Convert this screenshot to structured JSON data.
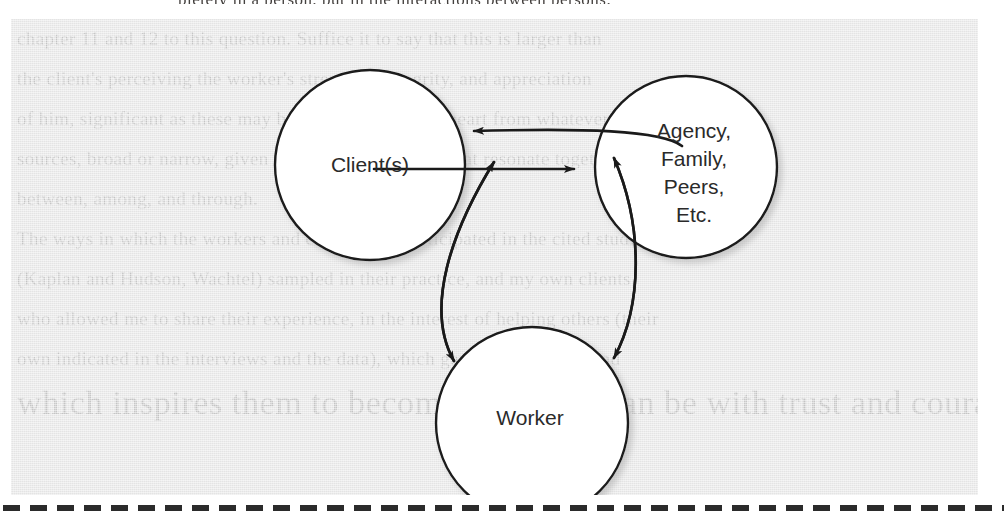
{
  "figure": {
    "panel_background_color": "#e4e4e4",
    "stroke_color": "#1a1a1a",
    "node_fill_color": "#ffffff",
    "nodes": [
      {
        "id": "client",
        "label": "Client(s)",
        "cx": 348,
        "cy": 127,
        "r": 95
      },
      {
        "id": "agency",
        "label": "Agency,\nFamily,\nPeers,\nEtc.",
        "cx": 664,
        "cy": 129,
        "r": 91
      },
      {
        "id": "worker",
        "label": "Worker",
        "cx": 510,
        "cy": 385,
        "r": 96
      }
    ],
    "node_labels": {
      "client": "Client(s)",
      "agency_line1": "Agency,",
      "agency_line2": "Family,",
      "agency_line3": "Peers,",
      "agency_line4": "Etc.",
      "worker": "Worker"
    },
    "connections": [
      {
        "from": "agency",
        "to": "client",
        "style": "arrow-single",
        "direction": "leftward",
        "description": "Agency/Family/Peers influence Client(s)"
      },
      {
        "from": "client",
        "to": "agency",
        "style": "arrow-single",
        "direction": "rightward",
        "description": "Client(s) influence Agency/Family/Peers"
      },
      {
        "from": "client",
        "to": "worker",
        "style": "arrow-double",
        "description": "Client(s) and Worker reciprocal relationship"
      },
      {
        "from": "agency",
        "to": "worker",
        "style": "arrow-double",
        "description": "Agency/Family/Peers and Worker reciprocal relationship"
      }
    ]
  },
  "scan": {
    "top_text_sliver": "pletely in a person, but in the interactions between persons.",
    "ghost_lines": [
      "chapter 11 and 12 to this question. Suffice it to say that this is larger than",
      "the client's perceiving the worker's strengths, integrity, and appreciation",
      "of him, significant as these may be; it also cuts to the heart from whatever",
      "sources, broad or narrow, given by words and actions that resonate together",
      "between, among, and through.",
      "The ways in which the workers and clients who participated in the cited studies",
      "(Kaplan and Hudson, Wachtel) sampled in their practice, and my own clients",
      "who allowed me to share their experience, in the interest of helping others (their",
      "own indicated in the interviews and the data), which gave life to theory and",
      "which inspires them to become who they can be with trust and courage.",
      "A Model of Helping Process"
    ]
  },
  "bottom_rule": {
    "style": "dashed",
    "color": "#2b2b2b"
  }
}
